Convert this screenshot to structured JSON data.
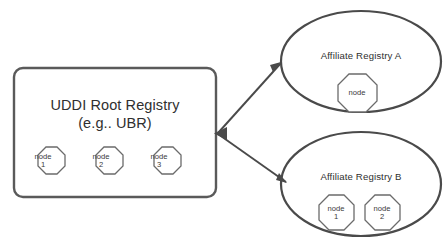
{
  "diagram": {
    "type": "uddi-registry-topology",
    "root_registry": {
      "title": "UDDI Root Registry",
      "subtitle": "(e.g.. UBR)",
      "shape": "rounded-rectangle",
      "nodes": [
        {
          "label": "node",
          "index": "1"
        },
        {
          "label": "node",
          "index": "2"
        },
        {
          "label": "node",
          "index": "3"
        }
      ]
    },
    "affiliates": [
      {
        "title": "Affiliate Registry A",
        "shape": "ellipse",
        "nodes": [
          {
            "label": "node",
            "index": ""
          }
        ]
      },
      {
        "title": "Affiliate Registry B",
        "shape": "ellipse",
        "nodes": [
          {
            "label": "node",
            "index": "1"
          },
          {
            "label": "node",
            "index": "2"
          }
        ]
      }
    ],
    "connectors": [
      {
        "from": "UDDI Root Registry",
        "to": "Affiliate Registry A",
        "style": "double-headed-arrow"
      },
      {
        "from": "UDDI Root Registry",
        "to": "Affiliate Registry B",
        "style": "double-headed-arrow"
      }
    ],
    "colors": {
      "background": "#ffffff",
      "box_stroke": "#5a5a5a",
      "ellipse_stroke": "#4a4a4a",
      "octagon_stroke": "#6b6b6b",
      "connector": "#4a4a4a",
      "text": "#2f2f2f"
    }
  }
}
